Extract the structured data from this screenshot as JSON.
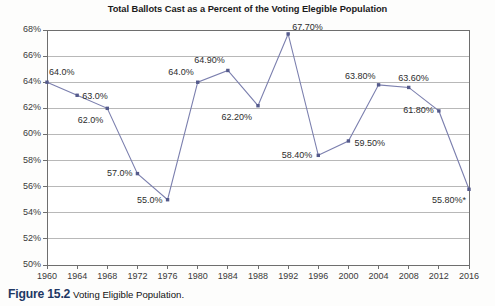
{
  "figure": {
    "caption_number": "Figure 15.2",
    "caption_text": "Voting Eligible Population."
  },
  "chart_data": {
    "type": "line",
    "title": "Total Ballots Cast as a Percent of the Voting Elegible Population",
    "xlabel": "",
    "ylabel": "",
    "categories": [
      "1960",
      "1964",
      "1968",
      "1972",
      "1976",
      "1980",
      "1984",
      "1988",
      "1992",
      "1996",
      "2000",
      "2004",
      "2008",
      "2012",
      "2016"
    ],
    "values": [
      64.0,
      63.0,
      62.0,
      57.0,
      55.0,
      64.0,
      64.9,
      62.2,
      67.7,
      58.4,
      59.5,
      63.8,
      63.6,
      61.8,
      55.8
    ],
    "point_labels": [
      "64.0%",
      "63.0%",
      "62.0%",
      "57.0%",
      "55.0%",
      "64.0%",
      "64.90%",
      "62.20%",
      "67.70%",
      "58.40%",
      "59.50%",
      "63.80%",
      "63.60%",
      "61.80%",
      "55.80%*"
    ],
    "ylim": [
      50,
      68
    ],
    "ytick_labels": [
      "68%",
      "66%",
      "64%",
      "62%",
      "60%",
      "58%",
      "56%",
      "54%",
      "52%",
      "50%"
    ],
    "ytick_values": [
      68,
      66,
      64,
      62,
      60,
      58,
      56,
      54,
      52,
      50
    ],
    "xtick_labels": [
      "1960",
      "1964",
      "1968",
      "1972",
      "1976",
      "1980",
      "1984",
      "1988",
      "1992",
      "1996",
      "2000",
      "2004",
      "2008",
      "2012",
      "2016"
    ],
    "grid": true,
    "legend": "none",
    "series_color": "#7b7fae",
    "grid_color": "#9a9a9a",
    "axis_color": "#6e6e6e"
  }
}
